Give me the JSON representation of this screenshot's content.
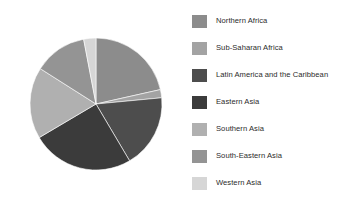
{
  "chart_data": {
    "type": "pie",
    "title": "",
    "subtitle": "",
    "xlabel": "",
    "ylabel": "",
    "grid": false,
    "legend_position": "right",
    "start_angle_deg": 90,
    "direction": "clockwise",
    "categories": [
      "Northern Africa",
      "Sub-Saharan Africa",
      "Latin America and the Caribbean",
      "Eastern Asia",
      "Southern Asia",
      "South-Eastern Asia",
      "Western Asia"
    ],
    "values": [
      21.5,
      2.0,
      18.0,
      25.0,
      17.5,
      13.0,
      3.0
    ],
    "units": "percent",
    "colors": [
      "#8c8c8c",
      "#a3a3a3",
      "#4d4d4d",
      "#3b3b3b",
      "#b0b0b0",
      "#949494",
      "#d6d6d6"
    ],
    "slices": [
      {
        "label": "Northern Africa",
        "value": 21.5,
        "color": "#8c8c8c"
      },
      {
        "label": "Sub-Saharan Africa",
        "value": 2.0,
        "color": "#a3a3a3"
      },
      {
        "label": "Latin America and the Caribbean",
        "value": 18.0,
        "color": "#4d4d4d"
      },
      {
        "label": "Eastern Asia",
        "value": 25.0,
        "color": "#3b3b3b"
      },
      {
        "label": "Southern Asia",
        "value": 17.5,
        "color": "#b0b0b0"
      },
      {
        "label": "South-Eastern Asia",
        "value": 13.0,
        "color": "#949494"
      },
      {
        "label": "Western Asia",
        "value": 3.0,
        "color": "#d6d6d6"
      }
    ]
  },
  "figure": {
    "background": "#ffffff",
    "pie": {
      "center_x": 96,
      "center_y": 104,
      "radius": 66,
      "edge_color": "#ffffff",
      "edge_width": 0.6
    },
    "legend": {
      "x": 192,
      "y": 14,
      "row_spacing": 27,
      "swatch_width": 15,
      "swatch_height": 13,
      "text_color": "#2b2b2b",
      "font_size": 7.6,
      "entries": [
        {
          "label": "Northern Africa",
          "color": "#8c8c8c"
        },
        {
          "label": "Sub-Saharan Africa",
          "color": "#a3a3a3"
        },
        {
          "label": "Latin America and the Caribbean",
          "color": "#4d4d4d"
        },
        {
          "label": "Eastern Asia",
          "color": "#3b3b3b"
        },
        {
          "label": "Southern Asia",
          "color": "#b0b0b0"
        },
        {
          "label": "South-Eastern Asia",
          "color": "#949494"
        },
        {
          "label": "Western Asia",
          "color": "#d6d6d6"
        }
      ]
    }
  }
}
